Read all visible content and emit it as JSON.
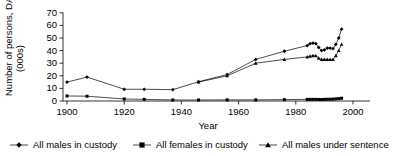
{
  "chart_data": {
    "type": "line",
    "title": "",
    "xlabel": "Year",
    "ylabel": "Number of persons, DAP (000s)",
    "xlim": [
      1900,
      2000
    ],
    "ylim": [
      0,
      70
    ],
    "xticks": [
      1900,
      1920,
      1940,
      1960,
      1980,
      2000
    ],
    "yticks": [
      0,
      10,
      20,
      30,
      40,
      50,
      60,
      70
    ],
    "grid": false,
    "legend_position": "bottom",
    "series": [
      {
        "name": "All males in custody",
        "marker": "diamond",
        "x": [
          1900,
          1907,
          1920,
          1927,
          1937,
          1946,
          1956,
          1966,
          1976,
          1984,
          1985,
          1986,
          1987,
          1988,
          1989,
          1990,
          1991,
          1992,
          1993,
          1994,
          1995,
          1996
        ],
        "y": [
          15,
          19,
          9.3,
          9.3,
          9,
          15.3,
          21,
          33,
          39.5,
          44,
          45.5,
          46,
          45.5,
          42.5,
          40,
          40.5,
          42,
          42,
          41.5,
          45,
          50,
          57
        ]
      },
      {
        "name": "All females in custody",
        "marker": "square",
        "x": [
          1900,
          1907,
          1920,
          1927,
          1937,
          1946,
          1956,
          1966,
          1976,
          1984,
          1985,
          1986,
          1987,
          1988,
          1989,
          1990,
          1991,
          1992,
          1993,
          1994,
          1995,
          1996
        ],
        "y": [
          4,
          3.8,
          1.6,
          1.3,
          0.8,
          0.8,
          0.9,
          0.9,
          1.1,
          1.3,
          1.3,
          1.3,
          1.3,
          1.2,
          1.2,
          1.3,
          1.4,
          1.4,
          1.5,
          1.7,
          1.9,
          2.2
        ]
      },
      {
        "name": "All males under sentence",
        "marker": "triangle",
        "x": [
          1946,
          1956,
          1966,
          1976,
          1984,
          1985,
          1986,
          1987,
          1988,
          1989,
          1990,
          1991,
          1992,
          1993,
          1994,
          1995,
          1996
        ],
        "y": [
          15,
          20,
          30,
          33,
          35,
          35.5,
          36,
          36,
          34,
          33,
          33,
          33,
          33,
          33,
          36,
          40,
          45
        ]
      }
    ]
  },
  "axes": {
    "y_title": "Number of persons, DAP (000s)",
    "y_title_line1": "Number of persons, DAP",
    "y_title_line2": "(000s)",
    "x_title": "Year",
    "x_tick_labels": [
      "1900",
      "1920",
      "1940",
      "1960",
      "1980",
      "2000"
    ],
    "y_tick_labels": [
      "0",
      "10",
      "20",
      "30",
      "40",
      "50",
      "60",
      "70"
    ]
  },
  "legend": {
    "items": [
      {
        "label": "All males in custody",
        "marker": "diamond"
      },
      {
        "label": "All females in custody",
        "marker": "square"
      },
      {
        "label": "All males under sentence",
        "marker": "triangle"
      }
    ]
  },
  "colors": {
    "ink": "#000000",
    "background": "#ffffff"
  }
}
